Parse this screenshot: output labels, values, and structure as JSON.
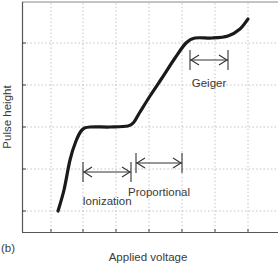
{
  "panel_label": "(b)",
  "chart_data": {
    "type": "line",
    "title": "",
    "xlabel": "Applied voltage",
    "ylabel": "Pulse height",
    "grid": true,
    "x_ticks_count": 7,
    "y_ticks_count": 5,
    "series": [
      {
        "name": "Pulse height vs applied voltage",
        "points": [
          [
            58,
            211
          ],
          [
            64,
            190
          ],
          [
            70,
            160
          ],
          [
            76,
            141
          ],
          [
            82,
            130
          ],
          [
            90,
            127
          ],
          [
            110,
            127
          ],
          [
            128,
            126
          ],
          [
            134,
            122
          ],
          [
            140,
            112
          ],
          [
            150,
            96
          ],
          [
            162,
            78
          ],
          [
            175,
            58
          ],
          [
            186,
            43
          ],
          [
            195,
            38
          ],
          [
            212,
            38
          ],
          [
            228,
            36
          ],
          [
            240,
            29
          ],
          [
            248,
            19
          ]
        ]
      }
    ],
    "annotations": [
      {
        "label": "Ionization",
        "x1": 83,
        "x2": 131,
        "y": 172,
        "label_y": 205
      },
      {
        "label": "Proportional",
        "x1": 136,
        "x2": 182,
        "y": 163,
        "label_y": 196
      },
      {
        "label": "Geiger",
        "x1": 190,
        "x2": 228,
        "y": 60,
        "label_y": 87
      }
    ]
  }
}
